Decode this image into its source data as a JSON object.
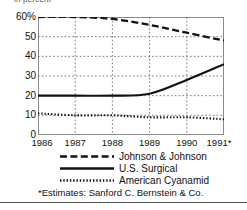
{
  "clipped_header": "in percent",
  "chart_data": {
    "type": "line",
    "title": "",
    "subtitle": "",
    "xlabel": "",
    "ylabel": "in percent",
    "x": [
      "1986",
      "1987",
      "1988",
      "1989",
      "1990",
      "1991*"
    ],
    "tick_labels_x": [
      "1986",
      "1987",
      "1988",
      "1989",
      "1990",
      "1991*"
    ],
    "tick_labels_y": [
      "0",
      "10",
      "20",
      "30",
      "40",
      "50",
      "60%"
    ],
    "ylim": [
      0,
      60
    ],
    "yticks": [
      0,
      10,
      20,
      30,
      40,
      50,
      60
    ],
    "grid": true,
    "grid_style": "dotted",
    "legend_position": "below",
    "series": [
      {
        "name": "Johnson & Johnson",
        "style": "dashed",
        "color": "#111111",
        "values": [
          60,
          60,
          59,
          56,
          52,
          48
        ]
      },
      {
        "name": "U.S. Surgical",
        "style": "solid",
        "color": "#111111",
        "values": [
          20,
          20,
          20,
          21,
          28,
          36
        ]
      },
      {
        "name": "American Cyanamid",
        "style": "dotted",
        "color": "#111111",
        "values": [
          11,
          10,
          10,
          9,
          9,
          8
        ]
      }
    ],
    "annotations": [
      "*Estimates: Sanford C. Bernstein & Co."
    ]
  },
  "legend": [
    {
      "label": "Johnson & Johnson",
      "style": "dashed"
    },
    {
      "label": "U.S. Surgical",
      "style": "solid"
    },
    {
      "label": "American Cyanamid",
      "style": "dotted"
    }
  ],
  "footnote": "*Estimates: Sanford C. Bernstein & Co."
}
